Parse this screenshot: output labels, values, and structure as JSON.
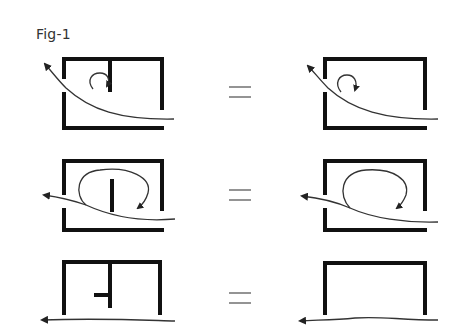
{
  "figure": {
    "title": "Fig-1",
    "colors": {
      "wall": "#111111",
      "flow": "#333333",
      "equals": "#666666"
    },
    "rows": [
      {
        "id": "row-1",
        "left": "room with top opening-left door, partial internal wall from top, vortex near wall; flow enters bottom-right and exits upper-left",
        "operator": "=",
        "right": "room without internal wall, same vortex; flow enters bottom-right and exits upper-left"
      },
      {
        "id": "row-2",
        "left": "room with free-standing internal wall, large circulating loop; flow enters bottom-right and exits left",
        "operator": "=",
        "right": "room without internal wall, large circulating loop; flow enters bottom-right and exits left"
      },
      {
        "id": "row-3",
        "left": "open-bottom room with T-shaped internal wall; flow passes straight underneath to the left",
        "operator": "=",
        "right": "open-bottom empty room; flow passes straight underneath to the left"
      }
    ]
  }
}
